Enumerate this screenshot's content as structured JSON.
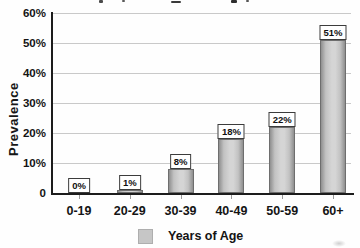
{
  "figure": {
    "width_px": 360,
    "height_px": 248,
    "background": "#fefefe"
  },
  "chart_data": {
    "type": "bar",
    "title": "",
    "title_cropped_at_top": true,
    "categories": [
      "0-19",
      "20-29",
      "30-39",
      "40-49",
      "50-59",
      "60+"
    ],
    "values": [
      0,
      1,
      8,
      18,
      22,
      51
    ],
    "bar_labels": [
      "0%",
      "1%",
      "8%",
      "18%",
      "22%",
      "51%"
    ],
    "xlabel": "Years of Age",
    "ylabel": "Prevalence",
    "ytick_labels": [
      "60%",
      "50%",
      "40%",
      "30%",
      "20%",
      "10%",
      "0"
    ],
    "ytick_values": [
      60,
      50,
      40,
      30,
      20,
      10,
      0
    ],
    "ylim": [
      0,
      60
    ],
    "grid": true,
    "legend": {
      "position": "bottom",
      "items": [
        {
          "label": "Years of Age",
          "swatch_color": "#c6c6c6"
        }
      ]
    },
    "colors": {
      "bar_fill_center": "#d5d5d5",
      "bar_fill_mid": "#c2c2c2",
      "bar_fill_edge": "#8f8f8f",
      "bar_border": "#6e6e6e",
      "label_box_bg": "#ffffff",
      "label_box_border": "#3c3c3c",
      "gridline": "#c9c9c9",
      "axis": "#1c1c1c",
      "tick": "#9a9a9a",
      "text": "#141414"
    }
  }
}
